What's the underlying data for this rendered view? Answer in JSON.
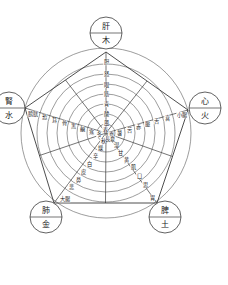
{
  "diagram": {
    "center": [
      106,
      133
    ],
    "outer_radius": 85,
    "ring_radii": [
      9,
      19,
      29,
      39,
      49,
      59,
      69,
      85
    ],
    "nodes": [
      {
        "id": "wood",
        "organ": "肝",
        "element": "木",
        "cx": 106,
        "cy": 33
      },
      {
        "id": "fire",
        "organ": "心",
        "element": "火",
        "cx": 205,
        "cy": 108
      },
      {
        "id": "earth",
        "organ": "脾",
        "element": "土",
        "cx": 165,
        "cy": 217
      },
      {
        "id": "metal",
        "organ": "肺",
        "element": "金",
        "cx": 46,
        "cy": 217
      },
      {
        "id": "water",
        "organ": "腎",
        "element": "水",
        "cx": 9,
        "cy": 108
      }
    ],
    "pentagon": [
      [
        106,
        52
      ],
      [
        188,
        110
      ],
      [
        157,
        203
      ],
      [
        54,
        203
      ],
      [
        25,
        108
      ]
    ],
    "branches": [
      {
        "element": "木",
        "labels": [
          {
            "text": "胆",
            "x": 106,
            "y": 62
          },
          {
            "text": "怒",
            "x": 106,
            "y": 74
          },
          {
            "text": "眼",
            "x": 106,
            "y": 85
          },
          {
            "text": "筋",
            "x": 106,
            "y": 94
          },
          {
            "text": "青",
            "x": 106,
            "y": 104
          },
          {
            "text": "酸",
            "x": 106,
            "y": 114
          },
          {
            "text": "風",
            "x": 106,
            "y": 123
          },
          {
            "text": "春",
            "x": 105,
            "y": 130
          }
        ]
      },
      {
        "element": "火",
        "labels": [
          {
            "text": "小腸",
            "x": 182,
            "y": 115
          },
          {
            "text": "喜",
            "x": 167,
            "y": 118
          },
          {
            "text": "舌",
            "x": 156,
            "y": 121
          },
          {
            "text": "脈",
            "x": 147,
            "y": 124
          },
          {
            "text": "赤",
            "x": 138,
            "y": 127
          },
          {
            "text": "苦",
            "x": 129,
            "y": 130
          },
          {
            "text": "暑",
            "x": 119,
            "y": 133
          },
          {
            "text": "夏",
            "x": 111,
            "y": 135
          }
        ]
      },
      {
        "element": "土",
        "labels": [
          {
            "text": "胃",
            "x": 152,
            "y": 198
          },
          {
            "text": "思",
            "x": 145,
            "y": 185
          },
          {
            "text": "口",
            "x": 139,
            "y": 176
          },
          {
            "text": "肌",
            "x": 133,
            "y": 167
          },
          {
            "text": "黄",
            "x": 126,
            "y": 160
          },
          {
            "text": "甘",
            "x": 120,
            "y": 153
          },
          {
            "text": "湿",
            "x": 116,
            "y": 145
          },
          {
            "text": "長夏",
            "x": 110,
            "y": 139
          }
        ]
      },
      {
        "element": "金",
        "labels": [
          {
            "text": "大腸",
            "x": 65,
            "y": 199
          },
          {
            "text": "悲",
            "x": 71,
            "y": 187
          },
          {
            "text": "鼻",
            "x": 78,
            "y": 180
          },
          {
            "text": "皮",
            "x": 83,
            "y": 172
          },
          {
            "text": "白",
            "x": 89,
            "y": 164
          },
          {
            "text": "辛",
            "x": 95,
            "y": 156
          },
          {
            "text": "燥",
            "x": 100,
            "y": 148
          },
          {
            "text": "秋",
            "x": 103,
            "y": 141
          }
        ]
      },
      {
        "element": "水",
        "labels": [
          {
            "text": "膀胱",
            "x": 33,
            "y": 114
          },
          {
            "text": "恐",
            "x": 44,
            "y": 117
          },
          {
            "text": "耳",
            "x": 54,
            "y": 120
          },
          {
            "text": "骨",
            "x": 64,
            "y": 123
          },
          {
            "text": "黒",
            "x": 73,
            "y": 126
          },
          {
            "text": "鹹",
            "x": 82,
            "y": 129
          },
          {
            "text": "寒",
            "x": 91,
            "y": 132
          },
          {
            "text": "冬",
            "x": 99,
            "y": 134
          }
        ]
      }
    ]
  }
}
